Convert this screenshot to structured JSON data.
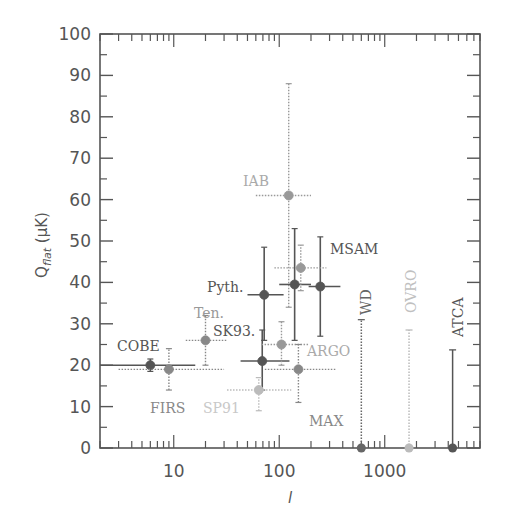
{
  "chart_data": {
    "type": "scatter",
    "title": "",
    "xlabel": "l",
    "ylabel": "Q_flat (μK)",
    "xscale": "log",
    "xlim": [
      2,
      8000
    ],
    "ylim": [
      0,
      100
    ],
    "grid": false,
    "xticks": [
      {
        "value": 10,
        "label": "10"
      },
      {
        "value": 100,
        "label": "100"
      },
      {
        "value": 1000,
        "label": "1000"
      }
    ],
    "yticks": [
      0,
      10,
      20,
      30,
      40,
      50,
      60,
      70,
      80,
      90,
      100
    ],
    "points": [
      {
        "experiment": "COBE",
        "l": 6,
        "l_min": 2,
        "l_max": 16,
        "Q": 20,
        "Q_low": 18.5,
        "Q_high": 21.5,
        "color": "#555555",
        "style": "solid"
      },
      {
        "experiment": "FIRS",
        "l": 9,
        "l_min": 3,
        "l_max": 30,
        "Q": 19,
        "Q_low": 14,
        "Q_high": 24,
        "color": "#888888",
        "style": "dotted"
      },
      {
        "experiment": "Ten.",
        "l": 20,
        "l_min": 13,
        "l_max": 32,
        "Q": 26,
        "Q_low": 20,
        "Q_high": 32,
        "color": "#888888",
        "style": "dotted"
      },
      {
        "experiment": "SK93",
        "l": 69,
        "l_min": 43,
        "l_max": 125,
        "Q": 21,
        "Q_low": 14,
        "Q_high": 28.5,
        "color": "#555555",
        "style": "solid"
      },
      {
        "experiment": "SP91",
        "l": 64,
        "l_min": 32,
        "l_max": 130,
        "Q": 14,
        "Q_low": 9,
        "Q_high": 17,
        "color": "#bbbbbb",
        "style": "dotted"
      },
      {
        "experiment": "Pyth.",
        "l": 72,
        "l_min": 50,
        "l_max": 110,
        "Q": 37,
        "Q_low": 26,
        "Q_high": 48.5,
        "color": "#555555",
        "style": "solid"
      },
      {
        "experiment": "ARGO",
        "l": 105,
        "l_min": 68,
        "l_max": 190,
        "Q": 25,
        "Q_low": 20,
        "Q_high": 30.5,
        "color": "#999999",
        "style": "dotted"
      },
      {
        "experiment": "MAX",
        "l": 152,
        "l_min": 73,
        "l_max": 340,
        "Q": 19,
        "Q_low": 11,
        "Q_high": 25,
        "color": "#888888",
        "style": "dotted"
      },
      {
        "experiment": "IAB",
        "l": 123,
        "l_min": 60,
        "l_max": 200,
        "Q": 61,
        "Q_low": 34,
        "Q_high": 88,
        "color": "#999999",
        "style": "dotted"
      },
      {
        "experiment": "MSAM",
        "l": 140,
        "l_min": 100,
        "l_max": 200,
        "Q": 39.5,
        "Q_low": 26,
        "Q_high": 53,
        "color": "#555555",
        "style": "solid"
      },
      {
        "experiment": "MSAM",
        "l": 245,
        "l_min": 190,
        "l_max": 380,
        "Q": 39,
        "Q_low": 27,
        "Q_high": 51,
        "color": "#555555",
        "style": "solid"
      },
      {
        "experiment": "MSAM",
        "l": 160,
        "l_min": 90,
        "l_max": 280,
        "Q": 43.5,
        "Q_low": 38,
        "Q_high": 49,
        "color": "#999999",
        "style": "dotted"
      }
    ],
    "upper_limits": [
      {
        "experiment": "WD",
        "l": 600,
        "Q_max": 31,
        "color": "#666666",
        "style": "dotted"
      },
      {
        "experiment": "OVRO",
        "l": 1700,
        "Q_max": 28.5,
        "color": "#bbbbbb",
        "style": "dotted"
      },
      {
        "experiment": "ATCA",
        "l": 4400,
        "Q_max": 23.7,
        "color": "#555555",
        "style": "solid"
      }
    ],
    "annotations": [
      {
        "text": "COBE",
        "x": 117,
        "y": 351,
        "color": "#555555",
        "rotate": 0
      },
      {
        "text": "FIRS",
        "x": 150,
        "y": 413,
        "color": "#888888",
        "rotate": 0
      },
      {
        "text": "Ten.",
        "x": 194,
        "y": 318,
        "color": "#999999",
        "rotate": 0
      },
      {
        "text": "SK93.",
        "x": 213,
        "y": 336,
        "color": "#555555",
        "rotate": 0
      },
      {
        "text": "SP91",
        "x": 203,
        "y": 413,
        "color": "#c8c8c8",
        "rotate": 0
      },
      {
        "text": "Pyth.",
        "x": 207,
        "y": 292,
        "color": "#555555",
        "rotate": 0
      },
      {
        "text": "ARGO",
        "x": 307,
        "y": 356,
        "color": "#aaaaaa",
        "rotate": 0
      },
      {
        "text": "MAX",
        "x": 309,
        "y": 426,
        "color": "#888888",
        "rotate": 0
      },
      {
        "text": "IAB",
        "x": 243,
        "y": 186,
        "color": "#aaaaaa",
        "rotate": 0
      },
      {
        "text": "MSAM",
        "x": 330,
        "y": 254,
        "color": "#555555",
        "rotate": 0
      },
      {
        "text": "WD",
        "x": 371,
        "y": 315,
        "color": "#666666",
        "rotate": -90
      },
      {
        "text": "OVRO",
        "x": 416,
        "y": 313,
        "color": "#c0c0c0",
        "rotate": -90
      },
      {
        "text": "ATCA",
        "x": 463,
        "y": 337,
        "color": "#555555",
        "rotate": -90
      }
    ]
  }
}
